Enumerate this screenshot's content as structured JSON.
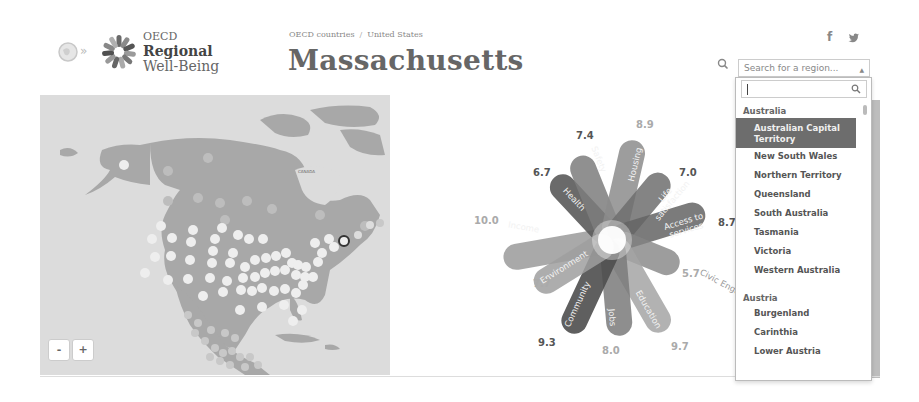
{
  "header": {
    "logo": {
      "line1": "OECD",
      "line2": "Regional",
      "line3": "Well-Being",
      "chevrons": "»"
    },
    "breadcrumb": {
      "items": [
        "OECD countries",
        "United States"
      ],
      "separator": "/"
    },
    "title": "Massachusetts",
    "social": {
      "facebook": "f",
      "twitter": "t"
    },
    "search": {
      "placeholder": "Search for a region...",
      "caret": "▲"
    }
  },
  "dropdown": {
    "search_value": "",
    "groups": [
      {
        "label": "Australia",
        "items": [
          {
            "label": "Australian Capital Territory",
            "selected": true
          },
          {
            "label": "New South Wales",
            "selected": false
          },
          {
            "label": "Northern Territory",
            "selected": false
          },
          {
            "label": "Queensland",
            "selected": false
          },
          {
            "label": "South Australia",
            "selected": false
          },
          {
            "label": "Tasmania",
            "selected": false
          },
          {
            "label": "Victoria",
            "selected": false
          },
          {
            "label": "Western Australia",
            "selected": false
          }
        ]
      },
      {
        "label": "Austria",
        "items": [
          {
            "label": "Burgenland",
            "selected": false
          },
          {
            "label": "Carinthia",
            "selected": false
          },
          {
            "label": "Lower Austria",
            "selected": false
          }
        ]
      }
    ]
  },
  "map": {
    "zoom_out": "-",
    "zoom_in": "+",
    "label_canada": "CANADA"
  },
  "flower": {
    "petals": [
      {
        "name": "Income",
        "value": "10.0"
      },
      {
        "name": "Health",
        "value": "6.7"
      },
      {
        "name": "Safety",
        "value": "7.4"
      },
      {
        "name": "Housing",
        "value": "8.9"
      },
      {
        "name": "Life satisfaction",
        "value": "7.0"
      },
      {
        "name": "Access to services",
        "value": "8.7"
      },
      {
        "name": "Civic Engagement",
        "value": "5.7"
      },
      {
        "name": "Education",
        "value": "9.7"
      },
      {
        "name": "Jobs",
        "value": "8.0"
      },
      {
        "name": "Community",
        "value": "9.3"
      },
      {
        "name": "Environment",
        "value": "7.7"
      }
    ]
  },
  "colors": {
    "selected_bg": "#6d6d6d",
    "map_land": "#a8a8a8",
    "map_water": "#dcdcdc",
    "highlight_ring": "#333333"
  }
}
